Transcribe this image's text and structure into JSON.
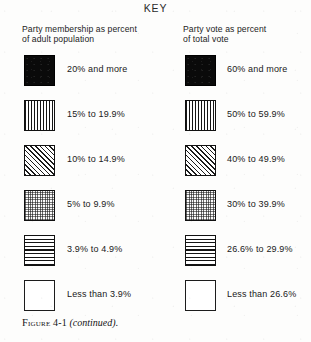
{
  "title": "KEY",
  "columns": [
    {
      "id": "party-membership",
      "heading": "Party membership as percent\nof adult population",
      "entries": [
        {
          "pattern": "solid",
          "label": "20% and more"
        },
        {
          "pattern": "vertical",
          "label": "15% to 19.9%"
        },
        {
          "pattern": "diagonal",
          "label": "10% to 14.9%"
        },
        {
          "pattern": "stipple",
          "label": "5% to 9.9%"
        },
        {
          "pattern": "horizontal",
          "label": "3.9% to 4.9%"
        },
        {
          "pattern": "empty",
          "label": "Less than 3.9%"
        }
      ]
    },
    {
      "id": "party-vote",
      "heading": "Party vote as percent\nof total vote",
      "entries": [
        {
          "pattern": "solid",
          "label": "60% and more"
        },
        {
          "pattern": "vertical",
          "label": "50% to 59.9%"
        },
        {
          "pattern": "diagonal",
          "label": "40% to 49.9%"
        },
        {
          "pattern": "stipple",
          "label": "30% to 39.9%"
        },
        {
          "pattern": "horizontal",
          "label": "26.6% to 29.9%"
        },
        {
          "pattern": "empty",
          "label": "Less than 26.6%"
        }
      ]
    }
  ],
  "caption": {
    "label": "Figure",
    "number": "4-1",
    "note": "(continued)",
    "terminator": "."
  },
  "colors": {
    "ink": "#141414",
    "paper": "#fdfdfc",
    "solid_fill": "#0a0a0a"
  }
}
